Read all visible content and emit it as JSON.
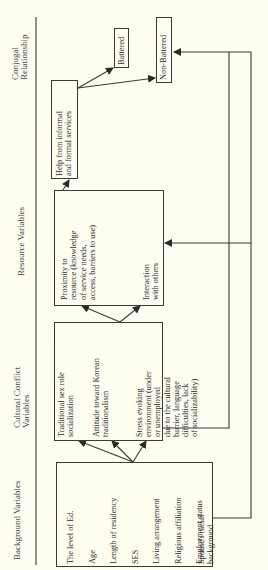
{
  "headers": {
    "background": "Background Variables",
    "cultural": [
      "Cultural Conflict",
      "Variables"
    ],
    "resource": "Resource Variables",
    "conjugal": [
      "Conjugal",
      "Relationship"
    ]
  },
  "background_variables": [
    "The level of Ed.",
    "Age",
    "Length of residency",
    "SES",
    "Living arrangement",
    "Religious affiliation",
    "Employment status",
    "Spouse's racial",
    "background"
  ],
  "cultural_conflict_variables": {
    "item1": [
      "Traditional sex role",
      "socialization"
    ],
    "item2": [
      "Attitude toward Korean",
      "traditionalism"
    ],
    "item3": [
      "Stress evoking",
      "environment (under",
      "or unemployed",
      "due to the cultural",
      "barrier, language",
      "difficulties, lack",
      "of socializability)"
    ]
  },
  "resource_variables": {
    "item1": [
      "Proximity to",
      "resource (knowledge",
      "of service needs,",
      "access, barriers to use)"
    ],
    "item2": [
      "Interaction",
      "with others"
    ]
  },
  "help_box": [
    "Help from informal",
    "and formal services"
  ],
  "outcomes": {
    "battered": "Battered",
    "non_battered": "Non-Battered"
  },
  "colors": {
    "line": "#3a3a36",
    "background": "#fdfdf0"
  }
}
